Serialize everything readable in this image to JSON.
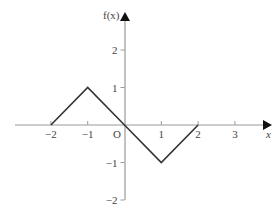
{
  "chart_data": {
    "type": "line",
    "title": "",
    "xlabel": "x",
    "ylabel": "f(x)",
    "xlim": [
      -3,
      3.8
    ],
    "ylim": [
      -2,
      3
    ],
    "grid": false,
    "origin_label": "O",
    "x_ticks": [
      -2,
      -1,
      1,
      2,
      3
    ],
    "x_tick_labels": [
      "−2",
      "−1",
      "1",
      "2",
      "3"
    ],
    "y_ticks": [
      -2,
      -1,
      1,
      2
    ],
    "y_tick_labels": [
      "−2",
      "−1",
      "1",
      "2"
    ],
    "series": [
      {
        "name": "f(x)",
        "x": [
          -2,
          -1,
          0,
          1,
          2
        ],
        "y": [
          0,
          1,
          0,
          -1,
          0
        ]
      }
    ]
  },
  "style": {
    "axis_color": "#999999",
    "line_color": "#333333",
    "text_color": "#444444"
  }
}
